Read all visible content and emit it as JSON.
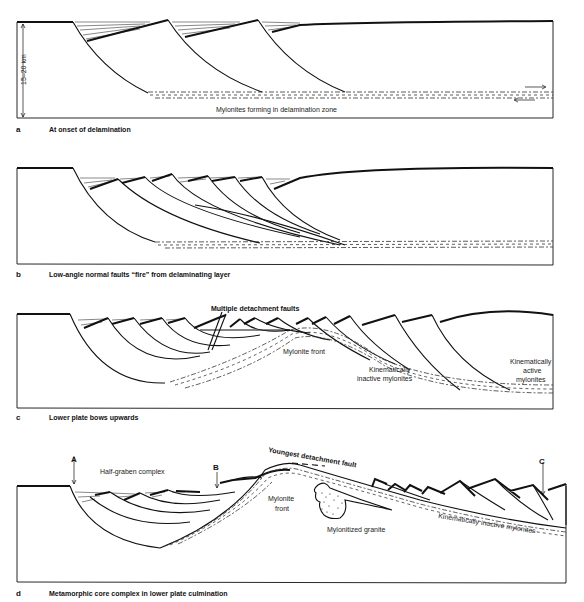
{
  "panels": [
    {
      "id": "a",
      "letter": "a",
      "caption": "At onset of delamination",
      "labels": {
        "scale": "15–20 km",
        "mylonites": "Mylonites forming in delamination zone"
      }
    },
    {
      "id": "b",
      "letter": "b",
      "caption": "Low-angle normal faults “fire” from delaminating layer",
      "labels": {}
    },
    {
      "id": "c",
      "letter": "c",
      "caption": "Lower plate bows upwards",
      "labels": {
        "multiple_detachment": "Multiple detachment faults",
        "mylonite_front": "Mylonite front",
        "inactive_1": "Kinematically",
        "inactive_2": "inactive mylonites",
        "active_1": "Kinematically",
        "active_2": "active",
        "active_3": "mylonites"
      }
    },
    {
      "id": "d",
      "letter": "d",
      "caption": "Metamorphic core complex in lower plate culmination",
      "labels": {
        "marker_a": "A",
        "marker_b": "B",
        "marker_c": "C",
        "half_graben": "Half-graben complex",
        "youngest_fault": "Youngest detachment fault",
        "mylonite_front_1": "Mylonite",
        "mylonite_front_2": "front",
        "mylonitized_granite": "Mylonitized granite",
        "inactive": "Kinematically inactive mylonites"
      }
    }
  ]
}
